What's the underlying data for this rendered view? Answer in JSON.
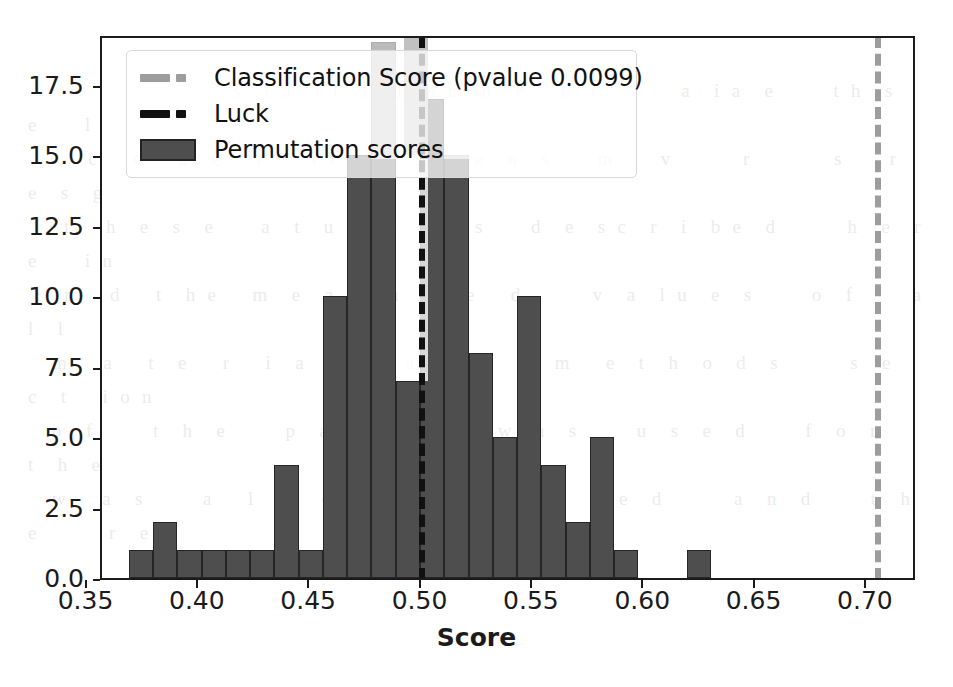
{
  "figure": {
    "background": "#ffffff",
    "axes_color": "#1b1b1b"
  },
  "legend": {
    "items": [
      {
        "label": "Classification Score (pvalue 0.0099)",
        "style": "dashed-line",
        "color": "#9d9d9d"
      },
      {
        "label": "Luck",
        "style": "dashed-line",
        "color": "#111111"
      },
      {
        "label": "Permutation scores",
        "style": "filled-patch",
        "color": "#4e4e4e"
      }
    ]
  },
  "chart_data": {
    "type": "bar",
    "title": "",
    "xlabel": "Score",
    "ylabel": "",
    "xlim": [
      0.3565,
      0.7225
    ],
    "ylim": [
      0,
      19.3
    ],
    "grid": false,
    "legend_position": "upper left",
    "bar_color": "#4e4e4e",
    "bar_edge_color": "#262626",
    "bin_width": 0.0109,
    "xticks": [
      "0.35",
      "0.40",
      "0.45",
      "0.50",
      "0.55",
      "0.60",
      "0.65",
      "0.70"
    ],
    "xtick_values": [
      0.35,
      0.4,
      0.45,
      0.5,
      0.55,
      0.6,
      0.65,
      0.7
    ],
    "yticks": [
      "0.0",
      "2.5",
      "5.0",
      "7.5",
      "10.0",
      "12.5",
      "15.0",
      "17.5"
    ],
    "ytick_values": [
      0.0,
      2.5,
      5.0,
      7.5,
      10.0,
      12.5,
      15.0,
      17.5
    ],
    "series": [
      {
        "name": "Permutation scores",
        "bin_left_edges": [
          0.3685,
          0.3794,
          0.3903,
          0.4012,
          0.4121,
          0.423,
          0.4339,
          0.4448,
          0.4557,
          0.4666,
          0.4775,
          0.4884,
          0.4993,
          0.5102,
          0.5211,
          0.532,
          0.5429,
          0.5538,
          0.5647,
          0.5756,
          0.5865,
          0.5974,
          0.6083,
          0.6192,
          0.6301,
          0.641
        ],
        "values": [
          1,
          2,
          1,
          1,
          1,
          1,
          4,
          1,
          10,
          15,
          19,
          7,
          17,
          15,
          8,
          5,
          10,
          4,
          2,
          5,
          1,
          0,
          0,
          1
        ]
      }
    ],
    "annotations": [
      {
        "name": "Luck",
        "type": "vline",
        "x": 0.5,
        "color": "#111111",
        "linestyle": "dashed"
      },
      {
        "name": "Classification Score",
        "type": "vline",
        "x": 0.705,
        "color": "#9d9d9d",
        "linestyle": "dashed",
        "pvalue": "0.0099"
      }
    ]
  },
  "bleed_text": "                                                                                                             \n                                                                                                       \n                 s  i a  t l  i  d  n n  h  e   f  t       a  i a  e     t h  s  e    l\n     c   o   a  e   r    r t   o     a  e  n  s    m    v      r       s    r   e  s  g\n   t   h  e  s  e    a  t  u  r  e   i   s    d  e  s c  r  i  b e  d      h  e  r e    i n\n   n   d   t  h e   m  e  a  s  u  r   e   d      v  a  l u  e  s     o  f     a   l  l\n  m   a   t  e   r   i  a  l      a  n  d      m   e  t  h  o  d  s      s  e   c  t   i o n\n  o  f     t  h  e     p  a  p  e  r      w  a  s     u  s  e  d     f  o  r     t  h  e\n  w   a  s     a   l   s  o       c  o  m  p  u  t  e  d      a  n  d     t  h  e      r  e\n"
}
